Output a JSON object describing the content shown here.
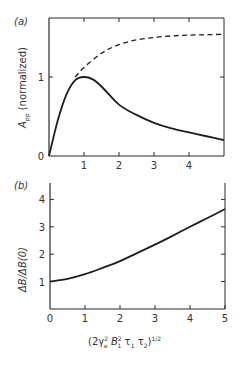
{
  "chart_data": [
    {
      "type": "line",
      "panel": "(a)",
      "title": "",
      "xlabel": "",
      "ylabel": "A_pp (normalized)",
      "xlim": [
        0,
        5
      ],
      "ylim": [
        0,
        1.7
      ],
      "x_ticks": [
        "1",
        "2",
        "3",
        "4"
      ],
      "y_ticks": [
        "0",
        "1"
      ],
      "grid": false,
      "series": [
        {
          "name": "solid",
          "style": "solid",
          "x": [
            0,
            0.25,
            0.5,
            0.75,
            1.0,
            1.25,
            1.5,
            2.0,
            2.5,
            3.0,
            3.5,
            4.0,
            4.5,
            5.0
          ],
          "y": [
            0,
            0.45,
            0.78,
            0.96,
            1.0,
            0.97,
            0.88,
            0.65,
            0.52,
            0.42,
            0.35,
            0.3,
            0.25,
            0.2
          ]
        },
        {
          "name": "dashed",
          "style": "dashed",
          "x": [
            0.75,
            1.0,
            1.5,
            2.0,
            2.5,
            3.0,
            3.5,
            4.0,
            4.5,
            5.0
          ],
          "y": [
            1.0,
            1.12,
            1.3,
            1.41,
            1.47,
            1.5,
            1.52,
            1.53,
            1.535,
            1.54
          ]
        }
      ]
    },
    {
      "type": "line",
      "panel": "(b)",
      "title": "",
      "xlabel": "(2γe² B1² τ1 τ2)^1/2",
      "ylabel": "ΔB/ΔB(0)",
      "xlim": [
        0,
        5
      ],
      "ylim": [
        0,
        4.5
      ],
      "x_ticks": [
        "0",
        "1",
        "2",
        "3",
        "4",
        "5"
      ],
      "y_ticks": [
        "1",
        "2",
        "3",
        "4"
      ],
      "grid": false,
      "series": [
        {
          "name": "solid",
          "style": "solid",
          "x": [
            0,
            0.5,
            1,
            1.5,
            2,
            2.5,
            3,
            3.5,
            4,
            4.5,
            5
          ],
          "y": [
            1.0,
            1.1,
            1.27,
            1.5,
            1.75,
            2.05,
            2.35,
            2.67,
            3.0,
            3.32,
            3.65
          ]
        }
      ]
    }
  ],
  "labels": {
    "panel_a": "(a)",
    "panel_b": "(b)",
    "a_ylabel_main": "A",
    "a_ylabel_sub": "pp",
    "a_ylabel_rest": " (normalized)",
    "b_ylabel": "ΔB/ΔB(0)",
    "b_xlabel_pre": "(2γ",
    "b_xlabel_e": "e",
    "b_xlabel_mid": " B",
    "b_xlabel_1": "1",
    "b_xlabel_tau": " τ",
    "b_xlabel_t1": "1",
    "b_xlabel_tau2": " τ",
    "b_xlabel_t2": "2",
    "b_xlabel_close": ")",
    "b_xlabel_exp": "1/2",
    "sq": "2"
  }
}
